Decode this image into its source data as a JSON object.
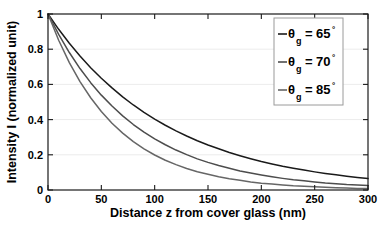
{
  "chart_data": {
    "type": "line",
    "title": "",
    "xlabel": "Distance z from cover glass (nm)",
    "ylabel": "Intensity I (normalized unit)",
    "xlim": [
      0,
      300
    ],
    "ylim": [
      0,
      1
    ],
    "xticks": [
      0,
      50,
      100,
      150,
      200,
      250,
      300
    ],
    "xtick_labels": [
      "0",
      "50",
      "100",
      "150",
      "200",
      "250",
      "300"
    ],
    "yticks": [
      0,
      0.2,
      0.4,
      0.6,
      0.8,
      1
    ],
    "ytick_labels": [
      "0",
      "0.2",
      "0.4",
      "0.6",
      "0.8",
      "1"
    ],
    "grid": "horizontal-light",
    "legend_position": "upper-right",
    "x": [
      0,
      10,
      20,
      30,
      40,
      50,
      60,
      70,
      80,
      90,
      100,
      110,
      120,
      130,
      140,
      150,
      160,
      170,
      180,
      190,
      200,
      210,
      220,
      230,
      240,
      250,
      260,
      270,
      280,
      290,
      300
    ],
    "series": [
      {
        "name": "theta_g = 65",
        "label_symbol": "θ",
        "label_subscript": "g",
        "label_equals": "=",
        "label_value": "65",
        "label_degree": "°",
        "color": "#1a1a1a",
        "decay_constant_nm": 110,
        "values": [
          1.0,
          0.913,
          0.834,
          0.761,
          0.695,
          0.635,
          0.58,
          0.529,
          0.483,
          0.441,
          0.403,
          0.368,
          0.336,
          0.307,
          0.28,
          0.256,
          0.234,
          0.213,
          0.195,
          0.178,
          0.162,
          0.148,
          0.135,
          0.124,
          0.113,
          0.103,
          0.094,
          0.086,
          0.078,
          0.071,
          0.065
        ]
      },
      {
        "name": "theta_g = 70",
        "label_symbol": "θ",
        "label_subscript": "g",
        "label_equals": "=",
        "label_value": "70",
        "label_degree": "°",
        "color": "#4d4d4d",
        "decay_constant_nm": 81,
        "values": [
          1.0,
          0.884,
          0.781,
          0.69,
          0.61,
          0.539,
          0.477,
          0.421,
          0.372,
          0.329,
          0.291,
          0.257,
          0.227,
          0.201,
          0.177,
          0.157,
          0.139,
          0.123,
          0.108,
          0.096,
          0.085,
          0.075,
          0.066,
          0.058,
          0.052,
          0.046,
          0.04,
          0.036,
          0.031,
          0.028,
          0.025
        ]
      },
      {
        "name": "theta_g = 85",
        "label_symbol": "θ",
        "label_subscript": "g",
        "label_equals": "=",
        "label_value": "85",
        "label_degree": "°",
        "color": "#666666",
        "decay_constant_nm": 62,
        "values": [
          1.0,
          0.851,
          0.724,
          0.616,
          0.524,
          0.446,
          0.379,
          0.323,
          0.275,
          0.234,
          0.199,
          0.169,
          0.144,
          0.122,
          0.104,
          0.089,
          0.075,
          0.064,
          0.055,
          0.046,
          0.039,
          0.034,
          0.029,
          0.024,
          0.021,
          0.018,
          0.015,
          0.013,
          0.011,
          0.009,
          0.008
        ]
      }
    ]
  }
}
